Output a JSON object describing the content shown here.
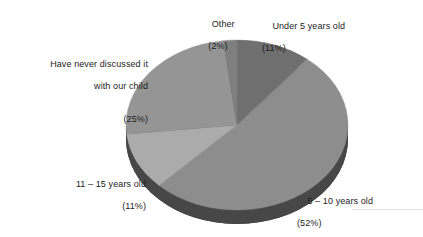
{
  "chart_data": {
    "type": "pie",
    "title": "",
    "subtitle": "",
    "xlabel": "",
    "ylabel": "",
    "legend_position": "none",
    "grid": false,
    "style": "3d-pie",
    "categories": [
      "Under 5 years old",
      "5 – 10 years old",
      "11 – 15 years old",
      "Have never discussed it with our child",
      "Other"
    ],
    "values": [
      11,
      52,
      11,
      25,
      2
    ],
    "unit": "%",
    "slices": [
      {
        "name": "Under 5 years old",
        "value": 11,
        "percent_label": "(11%)",
        "color": "#6f6f6f",
        "side_color": "#4a4a4a",
        "start_angle_deg": 0,
        "end_angle_deg": 39.6
      },
      {
        "name": "5 – 10 years old",
        "value": 52,
        "percent_label": "(52%)",
        "color": "#8d8d8d",
        "side_color": "#545454",
        "start_angle_deg": 39.6,
        "end_angle_deg": 226.8
      },
      {
        "name": "11 – 15 years old",
        "value": 11,
        "percent_label": "(11%)",
        "color": "#ababab",
        "side_color": "#5f5f5f",
        "start_angle_deg": 226.8,
        "end_angle_deg": 266.4
      },
      {
        "name": "Have never discussed it with our child",
        "value": 25,
        "percent_label": "(25%)",
        "color": "#959595",
        "side_color": "#565656",
        "start_angle_deg": 266.4,
        "end_angle_deg": 356.4
      },
      {
        "name": "Other",
        "value": 2,
        "percent_label": "(2%)",
        "color": "#7f7f7f",
        "side_color": "#4f4f4f",
        "start_angle_deg": 356.4,
        "end_angle_deg": 363.6
      }
    ]
  },
  "labels": {
    "other": {
      "line1": "Other",
      "pct": "(2%)"
    },
    "under5": {
      "line1": "Under 5 years old",
      "pct": "(11%)"
    },
    "never": {
      "line1": "Have never discussed it",
      "line2": "with our child",
      "pct": "(25%)"
    },
    "age1115": {
      "line1": "11 – 15 years old",
      "pct": "(11%)"
    },
    "age510": {
      "line1": "5 – 10 years old",
      "pct": "(52%)"
    }
  },
  "colors": {
    "background": "#ffffff",
    "text": "#1c1c1c",
    "rule": "#e2e2e2",
    "slice_under5": "#6f6f6f",
    "slice_510": "#8d8d8d",
    "slice_1115": "#ababab",
    "slice_never": "#959595",
    "slice_other": "#7f7f7f",
    "depth_dark": "#4a4a4a"
  }
}
